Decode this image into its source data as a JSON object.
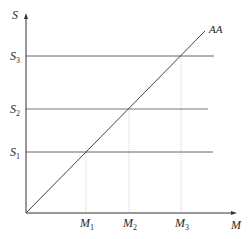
{
  "diagram": {
    "axes": {
      "y_label": "S",
      "x_label": "M"
    },
    "curve": {
      "label": "AA",
      "description": "45-degree line through origin"
    },
    "supply_levels": [
      {
        "base": "S",
        "sub": "1"
      },
      {
        "base": "S",
        "sub": "2"
      },
      {
        "base": "S",
        "sub": "3"
      }
    ],
    "money_levels": [
      {
        "base": "M",
        "sub": "1"
      },
      {
        "base": "M",
        "sub": "2"
      },
      {
        "base": "M",
        "sub": "3"
      }
    ],
    "colors": {
      "axis": "#333333",
      "line": "#555555",
      "guide": "#bbbbbb",
      "text": "#2a2a2a"
    }
  }
}
